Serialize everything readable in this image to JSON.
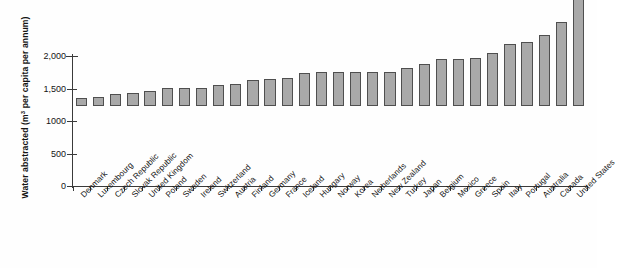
{
  "chart_data": {
    "type": "bar",
    "title": "",
    "xlabel": "",
    "ylabel": "Water abstracted (m³ per capita per annum)",
    "ylabel_prefix": "Water abstracted (m",
    "ylabel_sup": "3",
    "ylabel_suffix": " per capita per annum)",
    "ylim": [
      0,
      2000
    ],
    "yticks": [
      0,
      500,
      1000,
      1500,
      2000
    ],
    "ytick_labels": [
      "0",
      "500",
      "1000",
      "1,500",
      "2,000"
    ],
    "grid": false,
    "legend": "none",
    "bar_color": "#a9a9a9",
    "bar_border_color": "#4f4f4f",
    "axis_color": "#3a3a3a",
    "categories": [
      "Denmark",
      "Luxembourg",
      "Czech Republic",
      "Slovak Republic",
      "United Kingdom",
      "Poland",
      "Sweden",
      "Ireland",
      "Switzerland",
      "Austria",
      "Finland",
      "Germany",
      "France",
      "Iceland",
      "Hungary",
      "Norway",
      "Korea",
      "Netherlands",
      "New Zealand",
      "Turkey",
      "Japan",
      "Belgium",
      "Mexico",
      "Greece",
      "Spain",
      "Italy",
      "Portugal",
      "Australia",
      "Canada",
      "United States"
    ],
    "values": [
      120,
      140,
      185,
      200,
      225,
      275,
      280,
      280,
      320,
      345,
      400,
      420,
      430,
      510,
      520,
      530,
      530,
      530,
      530,
      580,
      640,
      720,
      730,
      740,
      820,
      960,
      990,
      1090,
      1300,
      1750
    ]
  }
}
